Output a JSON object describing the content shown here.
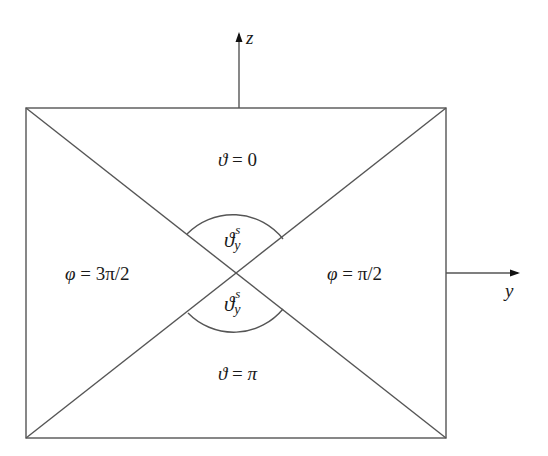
{
  "diagram": {
    "stroke_color": "#555555",
    "axes": {
      "z": {
        "label": "z"
      },
      "y": {
        "label": "y"
      }
    },
    "regions": {
      "top": {
        "symbol": "ϑ",
        "eq": " = ",
        "value": "0"
      },
      "bottom": {
        "symbol": "ϑ",
        "eq": " = ",
        "value": "π"
      },
      "left": {
        "symbol": "φ",
        "eq": " = ",
        "value": "3π/2"
      },
      "right": {
        "symbol": "φ",
        "eq": " = ",
        "value": "π/2"
      }
    },
    "angles": {
      "upper": {
        "symbol": "ϑ",
        "superscript": "s",
        "subscript": "y"
      },
      "lower": {
        "symbol": "ϑ",
        "superscript": "s",
        "subscript": "y"
      }
    }
  }
}
